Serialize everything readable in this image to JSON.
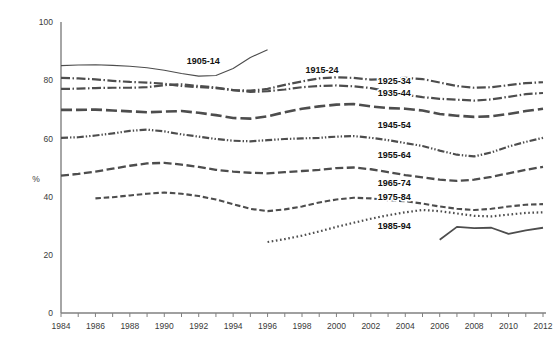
{
  "chart_data": {
    "type": "line",
    "title": "",
    "xlabel": "",
    "ylabel": "%",
    "xlim": [
      1984,
      2012
    ],
    "ylim": [
      0,
      100
    ],
    "grid": false,
    "legend": "inline-labels",
    "ytick_labels": [
      "0",
      "20",
      "40",
      "60",
      "80",
      "100"
    ],
    "ytick_values": [
      0,
      20,
      40,
      60,
      80,
      100
    ],
    "xtick_values": [
      1984,
      1985,
      1986,
      1987,
      1988,
      1989,
      1990,
      1991,
      1992,
      1993,
      1994,
      1995,
      1996,
      1997,
      1998,
      1999,
      2000,
      2001,
      2002,
      2003,
      2004,
      2005,
      2006,
      2007,
      2008,
      2009,
      2010,
      2011,
      2012
    ],
    "xtick_labels": [
      "1984",
      "1986",
      "1988",
      "1990",
      "1992",
      "1994",
      "1996",
      "1998",
      "2000",
      "2002",
      "2004",
      "2006",
      "2008",
      "2010",
      "2012"
    ],
    "xtick_labelled_values": [
      1984,
      1986,
      1988,
      1990,
      1992,
      1994,
      1996,
      1998,
      2000,
      2002,
      2004,
      2006,
      2008,
      2010,
      2012
    ],
    "line_color": "#4d4d4d",
    "series": [
      {
        "name": "1905-14",
        "label": "1905-14",
        "style": "solid",
        "dasharray": "",
        "width": 1.1,
        "label_x": 1991.3,
        "label_y": 86.5,
        "x": [
          1984,
          1985,
          1986,
          1987,
          1988,
          1989,
          1990,
          1991,
          1992,
          1993,
          1994,
          1995,
          1996
        ],
        "y": [
          85.0,
          85.2,
          85.3,
          85.1,
          84.8,
          84.3,
          83.4,
          82.3,
          81.4,
          81.6,
          84.0,
          87.8,
          90.5
        ]
      },
      {
        "name": "1915-24",
        "label": "1915-24",
        "style": "dashdot",
        "dasharray": "9,2.5,1.5,2.5",
        "width": 2.2,
        "label_x": 1998.2,
        "label_y": 83.5,
        "x": [
          1984,
          1985,
          1986,
          1987,
          1988,
          1989,
          1990,
          1991,
          1992,
          1993,
          1994,
          1995,
          1996,
          1997,
          1998,
          1999,
          2000,
          2001,
          2002,
          2003,
          2004,
          2005,
          2006,
          2007,
          2008,
          2009,
          2010,
          2011,
          2012
        ],
        "y": [
          80.8,
          80.6,
          80.3,
          79.8,
          79.4,
          79.2,
          78.8,
          78.0,
          77.6,
          77.3,
          76.6,
          76.0,
          76.2,
          76.8,
          77.6,
          78.0,
          78.2,
          77.9,
          77.3,
          76.2,
          75.0,
          74.2,
          73.6,
          73.3,
          73.0,
          73.4,
          74.3,
          75.2,
          75.6
        ]
      },
      {
        "name": "1925-34",
        "label": "1925-34",
        "style": "dashdot",
        "dasharray": "9,2.5,1.5,2.5",
        "width": 2.2,
        "label_x": 2002.4,
        "label_y": 79.7,
        "x": [
          1984,
          1985,
          1986,
          1987,
          1988,
          1989,
          1990,
          1991,
          1992,
          1993,
          1994,
          1995,
          1996,
          1997,
          1998,
          1999,
          2000,
          2001,
          2002,
          2003,
          2004,
          2005,
          2006,
          2007,
          2008,
          2009,
          2010,
          2011,
          2012
        ],
        "y": [
          77.0,
          77.1,
          77.3,
          77.4,
          77.4,
          77.6,
          78.3,
          78.6,
          78.0,
          77.5,
          76.6,
          76.4,
          77.0,
          78.4,
          79.6,
          80.6,
          81.0,
          80.8,
          80.2,
          80.4,
          80.8,
          80.4,
          79.2,
          78.0,
          77.4,
          77.6,
          78.3,
          79.0,
          79.3
        ]
      },
      {
        "name": "1935-44",
        "label": "1935-44",
        "style": "dashed-long",
        "dasharray": "11,4",
        "width": 2.6,
        "label_x": 2002.4,
        "label_y": 75.8,
        "x": [
          1984,
          1985,
          1986,
          1987,
          1988,
          1989,
          1990,
          1991,
          1992,
          1993,
          1994,
          1995,
          1996,
          1997,
          1998,
          1999,
          2000,
          2001,
          2002,
          2003,
          2004,
          2005,
          2006,
          2007,
          2008,
          2009,
          2010,
          2011,
          2012
        ],
        "y": [
          69.8,
          69.8,
          69.9,
          69.6,
          69.3,
          69.0,
          69.2,
          69.4,
          68.8,
          68.0,
          67.0,
          66.8,
          67.6,
          69.0,
          70.2,
          71.0,
          71.6,
          71.8,
          71.0,
          70.4,
          70.2,
          69.6,
          68.4,
          67.8,
          67.4,
          67.6,
          68.4,
          69.4,
          70.2
        ]
      },
      {
        "name": "1945-54",
        "label": "1945-54",
        "style": "dashdotdot",
        "dasharray": "7,2,1.4,2,1.4,2",
        "width": 2.2,
        "label_x": 2002.4,
        "label_y": 64.8,
        "x": [
          1984,
          1985,
          1986,
          1987,
          1988,
          1989,
          1990,
          1991,
          1992,
          1993,
          1994,
          1995,
          1996,
          1997,
          1998,
          1999,
          2000,
          2001,
          2002,
          2003,
          2004,
          2005,
          2006,
          2007,
          2008,
          2009,
          2010,
          2011,
          2012
        ],
        "y": [
          60.2,
          60.4,
          61.0,
          61.7,
          62.6,
          63.0,
          62.4,
          61.4,
          60.6,
          59.8,
          59.2,
          59.0,
          59.4,
          59.8,
          60.0,
          60.2,
          60.6,
          60.8,
          60.2,
          59.4,
          58.4,
          57.4,
          55.8,
          54.4,
          53.8,
          55.2,
          57.2,
          58.8,
          60.2
        ]
      },
      {
        "name": "1955-64",
        "label": "1955-64",
        "style": "dashed",
        "dasharray": "8,3.5",
        "width": 2.3,
        "label_x": 2002.4,
        "label_y": 54.3,
        "x": [
          1984,
          1985,
          1986,
          1987,
          1988,
          1989,
          1990,
          1991,
          1992,
          1993,
          1994,
          1995,
          1996,
          1997,
          1998,
          1999,
          2000,
          2001,
          2002,
          2003,
          2004,
          2005,
          2006,
          2007,
          2008,
          2009,
          2010,
          2011,
          2012
        ],
        "y": [
          47.2,
          47.8,
          48.6,
          49.6,
          50.6,
          51.4,
          51.6,
          51.0,
          50.2,
          49.2,
          48.6,
          48.2,
          48.0,
          48.4,
          48.8,
          49.2,
          49.8,
          50.0,
          49.4,
          48.4,
          47.4,
          46.6,
          45.8,
          45.4,
          45.8,
          46.8,
          48.0,
          49.2,
          50.2
        ]
      },
      {
        "name": "1965-74",
        "label": "1965-74",
        "style": "dashed-short",
        "dasharray": "5.5,2.8",
        "width": 2.1,
        "label_x": 2002.4,
        "label_y": 44.8,
        "x": [
          1986,
          1987,
          1988,
          1989,
          1990,
          1991,
          1992,
          1993,
          1994,
          1995,
          1996,
          1997,
          1998,
          1999,
          2000,
          2001,
          2002,
          2003,
          2004,
          2005,
          2006,
          2007,
          2008,
          2009,
          2010,
          2011,
          2012
        ],
        "y": [
          39.4,
          39.8,
          40.4,
          41.0,
          41.4,
          41.0,
          40.2,
          39.0,
          37.4,
          35.8,
          35.0,
          35.6,
          36.6,
          38.0,
          39.0,
          39.6,
          39.4,
          38.8,
          38.4,
          37.6,
          36.6,
          35.8,
          35.4,
          35.8,
          36.6,
          37.2,
          37.4
        ]
      },
      {
        "name": "1975-84",
        "label": "1975-84",
        "style": "dotted",
        "dasharray": "1.6,2.6",
        "width": 2.2,
        "label_x": 2002.4,
        "label_y": 40.0,
        "x": [
          1996,
          1997,
          1998,
          1999,
          2000,
          2001,
          2002,
          2003,
          2004,
          2005,
          2006,
          2007,
          2008,
          2009,
          2010,
          2011,
          2012
        ],
        "y": [
          24.4,
          25.4,
          26.6,
          28.0,
          29.6,
          31.0,
          32.4,
          33.6,
          34.6,
          35.4,
          35.0,
          34.2,
          33.4,
          33.2,
          33.8,
          34.4,
          34.6
        ]
      },
      {
        "name": "1985-94",
        "label": "1985-94",
        "style": "solid",
        "dasharray": "",
        "width": 1.8,
        "label_x": 2002.4,
        "label_y": 30.0,
        "x": [
          2006,
          2007,
          2008,
          2009,
          2010,
          2011,
          2012
        ],
        "y": [
          25.2,
          29.6,
          29.2,
          29.3,
          27.2,
          28.4,
          29.3
        ]
      }
    ]
  }
}
